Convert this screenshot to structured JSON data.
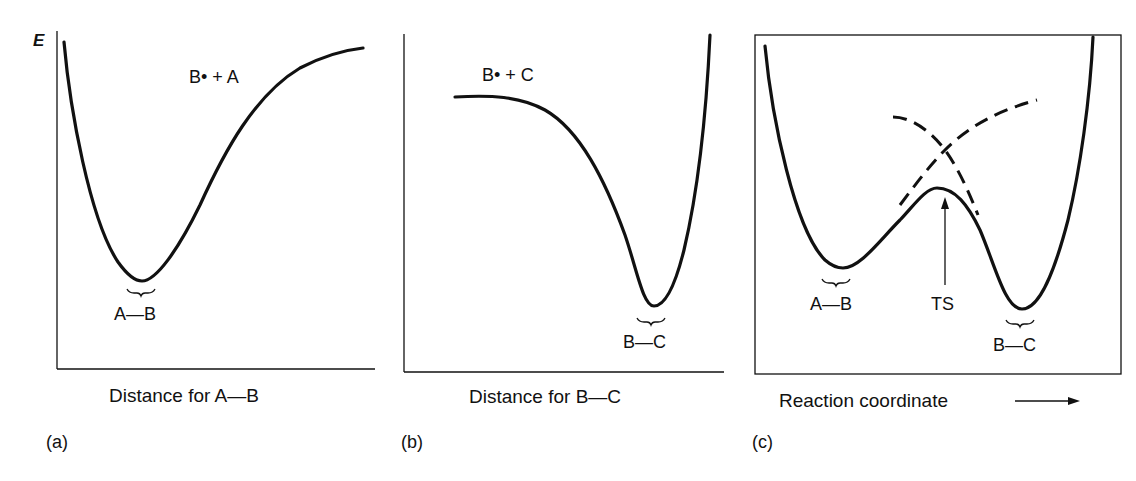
{
  "figure": {
    "energy_axis_label": "E",
    "panels": [
      {
        "id": "a",
        "panel_label": "(a)",
        "xlabel": "Distance for A—B",
        "species_label": "B• + A",
        "minimum_label": "A—B"
      },
      {
        "id": "b",
        "panel_label": "(b)",
        "xlabel": "Distance for B—C",
        "species_label": "B• + C",
        "minimum_label": "B—C"
      },
      {
        "id": "c",
        "panel_label": "(c)",
        "xlabel": "Reaction coordinate",
        "minimum_left_label": "A—B",
        "minimum_right_label": "B—C",
        "ts_label": "TS"
      }
    ],
    "colors": {
      "ink": "#111111",
      "background": "#ffffff"
    }
  }
}
